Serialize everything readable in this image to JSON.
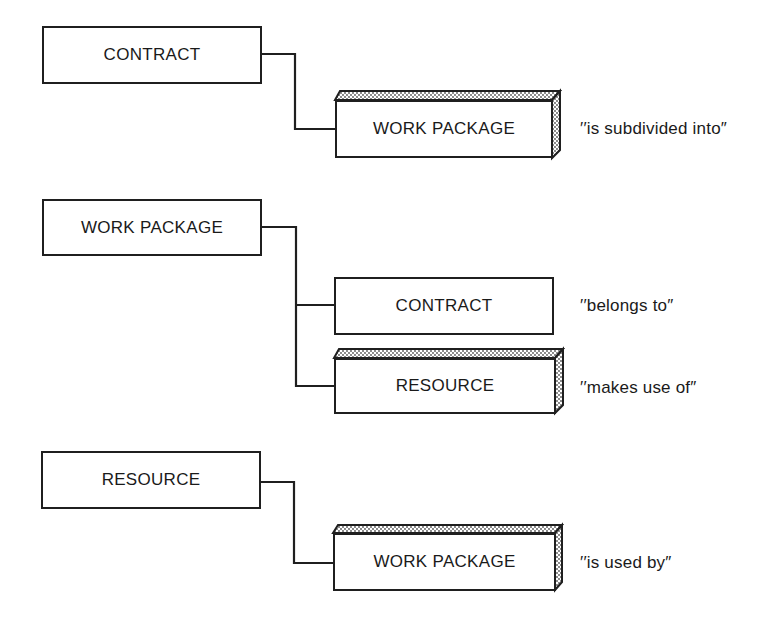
{
  "diagram": {
    "groups": [
      {
        "parent": {
          "label": "CONTRACT"
        },
        "children": [
          {
            "label": "WORK PACKAGE",
            "relation": "“‘is subdivided into”",
            "style": "3d-shaded"
          }
        ]
      },
      {
        "parent": {
          "label": "WORK PACKAGE"
        },
        "children": [
          {
            "label": "CONTRACT",
            "relation": "belongs to",
            "style": "plain"
          },
          {
            "label": "RESOURCE",
            "relation": "makes use of",
            "style": "3d-shaded"
          }
        ]
      },
      {
        "parent": {
          "label": "RESOURCE"
        },
        "children": [
          {
            "label": "WORK PACKAGE",
            "relation": "is used by",
            "style": "3d-shaded"
          }
        ]
      }
    ],
    "relations_display": {
      "r1": "′′is subdivided into″",
      "r2": "′′belongs to″",
      "r3": "′′makes use of″",
      "r4": "′′is used by″"
    },
    "colors": {
      "line": "#1f1f1f",
      "shade": "#bdbdbd",
      "background": "#ffffff"
    }
  }
}
